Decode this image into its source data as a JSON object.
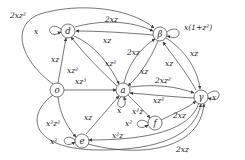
{
  "diagram": {
    "type": "state-transition-graph",
    "nodes": [
      {
        "id": "d",
        "label": "d"
      },
      {
        "id": "beta",
        "label": "β"
      },
      {
        "id": "o",
        "label": "o"
      },
      {
        "id": "a",
        "label": "a"
      },
      {
        "id": "gamma",
        "label": "γ"
      },
      {
        "id": "f",
        "label": "f"
      },
      {
        "id": "e",
        "label": "e"
      }
    ],
    "edges": [
      {
        "from": "o",
        "to": "beta",
        "label": "2xz²"
      },
      {
        "from": "d",
        "to": "beta",
        "label": "2xz"
      },
      {
        "from": "beta",
        "to": "d",
        "label": "xz"
      },
      {
        "from": "d",
        "to": "d",
        "label": "x"
      },
      {
        "from": "beta",
        "to": "beta",
        "label": "x(1+z²)"
      },
      {
        "from": "o",
        "to": "d",
        "label": "xz"
      },
      {
        "from": "a",
        "to": "d",
        "label": "xz²"
      },
      {
        "from": "d",
        "to": "a",
        "label": "xz²"
      },
      {
        "from": "a",
        "to": "beta",
        "label": "2xz"
      },
      {
        "from": "beta",
        "to": "a",
        "label": "xz"
      },
      {
        "from": "beta",
        "to": "gamma",
        "label": "xz"
      },
      {
        "from": "gamma",
        "to": "beta",
        "label": "xz"
      },
      {
        "from": "o",
        "to": "a",
        "label": "xz³"
      },
      {
        "from": "a",
        "to": "gamma",
        "label": "2xz²"
      },
      {
        "from": "gamma",
        "to": "a",
        "label": "xz²"
      },
      {
        "from": "gamma",
        "to": "gamma",
        "label": "x"
      },
      {
        "from": "a",
        "to": "a",
        "label": "x"
      },
      {
        "from": "a",
        "to": "f",
        "label": "x²z"
      },
      {
        "from": "f",
        "to": "f",
        "label": "x²"
      },
      {
        "from": "f",
        "to": "gamma",
        "label": "2xz"
      },
      {
        "from": "o",
        "to": "e",
        "label": "x²z²"
      },
      {
        "from": "e",
        "to": "a",
        "label": "xz"
      },
      {
        "from": "e",
        "to": "e",
        "label": "x²"
      },
      {
        "from": "gamma",
        "to": "e",
        "label": "x²z"
      },
      {
        "from": "o",
        "to": "gamma",
        "label": "2xz"
      },
      {
        "from": "e",
        "to": "gamma",
        "label": "2xz"
      }
    ]
  },
  "labels": {
    "n_d": "d",
    "n_beta": "β",
    "n_o": "o",
    "n_a": "a",
    "n_gamma": "γ",
    "n_f": "f",
    "n_e": "e",
    "o_beta": "2xz²",
    "d_beta": "2xz",
    "beta_d": "xz",
    "d_loop": "x",
    "beta_loop": "x(1+z²)",
    "o_d": "xz",
    "a_d": "xz²",
    "d_a": "xz²",
    "a_beta": "2xz",
    "beta_a": "xz",
    "beta_gamma": "xz",
    "gamma_beta": "xz",
    "o_a": "xz³",
    "a_gamma": "2xz²",
    "gamma_a": "xz²",
    "gamma_loop": "x",
    "a_loop": "x",
    "a_f": "x²z",
    "f_loop": "x²",
    "f_gamma": "2xz",
    "o_e": "x²z²",
    "e_a": "xz",
    "e_loop": "x²",
    "gamma_e": "x²z",
    "e_gamma": "2xz"
  }
}
